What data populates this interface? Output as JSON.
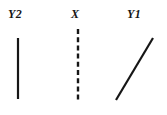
{
  "figure": {
    "background_color": "#ffffff",
    "stroke_color": "#161616",
    "width": 167,
    "height": 115,
    "labels": [
      {
        "id": "y2",
        "text": "Y2",
        "x": 8,
        "y": 8
      },
      {
        "id": "x",
        "text": "X",
        "x": 71,
        "y": 8
      },
      {
        "id": "y1",
        "text": "Y1",
        "x": 127,
        "y": 8
      }
    ],
    "segments": [
      {
        "id": "y2-line",
        "name": "vertical-solid-line",
        "style": "solid",
        "x1": 18,
        "y1": 38,
        "x2": 18,
        "y2": 99,
        "stroke_width": 2.2,
        "dash_pattern": ""
      },
      {
        "id": "x-line",
        "name": "vertical-dashed-line",
        "style": "dashed",
        "x1": 78,
        "y1": 29,
        "x2": 78,
        "y2": 101,
        "stroke_width": 2.4,
        "dash_pattern": "5 3.2"
      },
      {
        "id": "y1-line",
        "name": "diagonal-solid-line",
        "style": "solid",
        "x1": 116,
        "y1": 100,
        "x2": 153,
        "y2": 38,
        "stroke_width": 2.2,
        "dash_pattern": ""
      }
    ]
  }
}
